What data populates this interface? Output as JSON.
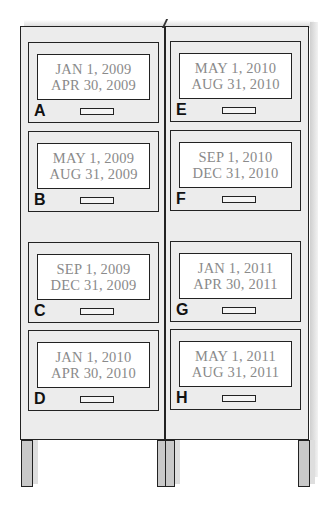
{
  "figure": {
    "colors": {
      "cabinet_fill": "#ececec",
      "label_fill": "#ffffff",
      "outline": "#222222",
      "date_text": "#8a8a8a",
      "leg_fill": "#c9c9c9"
    }
  },
  "cabinet": {
    "left_column": [
      {
        "letter": "A",
        "start": "JAN 1, 2009",
        "end": "APR 30, 2009"
      },
      {
        "letter": "B",
        "start": "MAY 1, 2009",
        "end": "AUG 31, 2009"
      },
      {
        "letter": "C",
        "start": "SEP 1, 2009",
        "end": "DEC 31, 2009"
      },
      {
        "letter": "D",
        "start": "JAN 1, 2010",
        "end": "APR 30, 2010"
      }
    ],
    "right_column": [
      {
        "letter": "E",
        "start": "MAY 1, 2010",
        "end": "AUG 31, 2010"
      },
      {
        "letter": "F",
        "start": "SEP 1, 2010",
        "end": "DEC 31, 2010"
      },
      {
        "letter": "G",
        "start": "JAN 1, 2011",
        "end": "APR 30, 2011"
      },
      {
        "letter": "H",
        "start": "MAY 1, 2011",
        "end": "AUG 31, 2011"
      }
    ]
  }
}
